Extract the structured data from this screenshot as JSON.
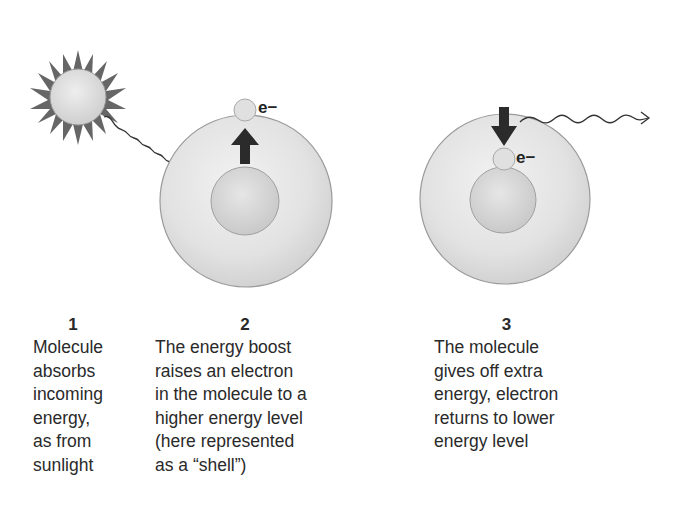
{
  "labels": {
    "electron_symbol": "e−"
  },
  "steps": [
    {
      "number": "1",
      "lines": [
        "Molecule",
        "absorbs",
        "incoming",
        "energy,",
        "as from",
        "sunlight"
      ]
    },
    {
      "number": "2",
      "lines": [
        "The energy boost",
        "raises an electron",
        "in the molecule to a",
        "higher energy level",
        "(here represented",
        "as a “shell”)"
      ]
    },
    {
      "number": "3",
      "lines": [
        "The molecule",
        "gives off extra",
        "energy, electron",
        "returns to lower",
        "energy level"
      ]
    }
  ],
  "colors": {
    "shell_fill": "#e4e4e4",
    "shell_stroke": "#9a9a9a",
    "core_fill": "#d6d6d6",
    "arrow": "#2b2b2b",
    "sun_spike": "#6a6a6a"
  }
}
